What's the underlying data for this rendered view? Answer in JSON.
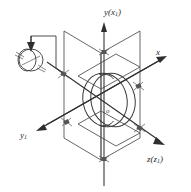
{
  "figure": {
    "background_color": "#ffffff",
    "line_color": "#3a3a3a",
    "axis_color": "#2e2e2e",
    "labels": {
      "vertical_axis": "y(x",
      "vertical_axis_sub": "1",
      "vertical_axis_tail": ")",
      "right_axis": "x",
      "lower_right_axis": "z(z",
      "lower_right_axis_sub": "1",
      "lower_right_axis_tail": ")",
      "lower_left_axis": "y",
      "lower_left_axis_sub": "1",
      "origin": "o"
    },
    "components": {
      "rotor": "rotor-disc",
      "plane_left": "gimbal-plane-left",
      "plane_right": "gimbal-plane-right",
      "drive_motor": "drive-motor",
      "drive_arrow": "drive-arrow-down",
      "bearings": "bearing-hatch-marks"
    }
  }
}
